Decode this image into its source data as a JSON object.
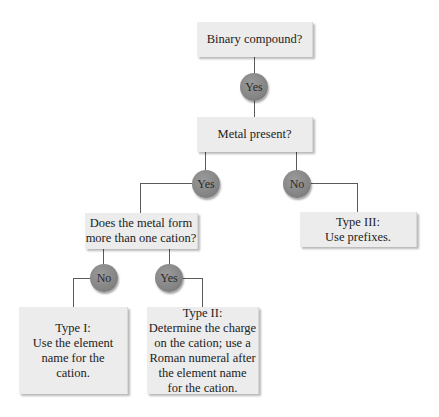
{
  "diagram": {
    "type": "flowchart",
    "questions": {
      "q1": "Binary compound?",
      "q2": "Metal present?",
      "q3_line1": "Does the metal form",
      "q3_line2": "more than one cation?"
    },
    "answers": {
      "q1_yes": "Yes",
      "q2_yes": "Yes",
      "q2_no": "No",
      "q3_no": "No",
      "q3_yes": "Yes"
    },
    "results": {
      "type1": {
        "lines": [
          "Type I:",
          "Use the element",
          "name for the",
          "cation."
        ]
      },
      "type2": {
        "lines": [
          "Type II:",
          "Determine the charge",
          "on the cation; use a",
          "Roman numeral after",
          "the element name",
          "for the cation."
        ]
      },
      "type3": {
        "lines": [
          "Type III:",
          "Use prefixes."
        ]
      }
    },
    "colors": {
      "box_fill": "#ececec",
      "node_fill": "#858585",
      "connector": "#5a5a5a"
    }
  }
}
